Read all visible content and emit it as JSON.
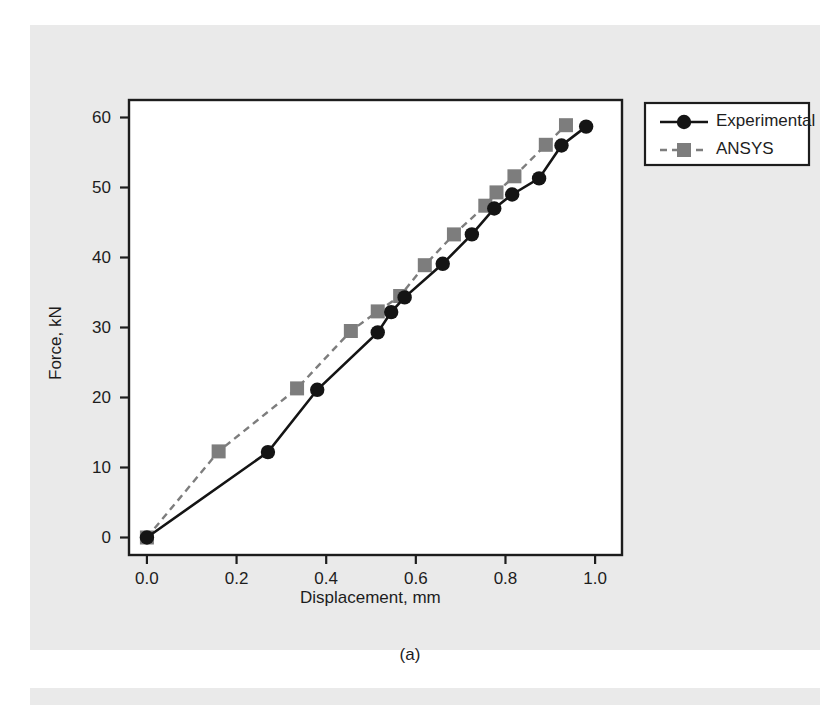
{
  "figure": {
    "caption": "(a)",
    "background_color": "#eaeaea",
    "plot_background_color": "#ffffff",
    "frame_color": "#1d1d1d"
  },
  "chart_data": {
    "type": "line",
    "title": "",
    "xlabel": "Displacement, mm",
    "ylabel": "Force, kN",
    "xlim": [
      -0.04,
      1.06
    ],
    "ylim": [
      -2.5,
      62.5
    ],
    "xticks": [
      "0.0",
      "0.2",
      "0.4",
      "0.6",
      "0.8",
      "1.0"
    ],
    "xtick_values": [
      0.0,
      0.2,
      0.4,
      0.6,
      0.8,
      1.0
    ],
    "yticks": [
      "0",
      "10",
      "20",
      "30",
      "40",
      "50",
      "60"
    ],
    "ytick_values": [
      0,
      10,
      20,
      30,
      40,
      50,
      60
    ],
    "grid": false,
    "legend_position": "outside top-right",
    "series": [
      {
        "name": "Experimental",
        "color": "#141414",
        "marker": "circle",
        "linestyle": "solid",
        "x": [
          0.0,
          0.27,
          0.38,
          0.515,
          0.545,
          0.575,
          0.66,
          0.725,
          0.775,
          0.815,
          0.875,
          0.925,
          0.98
        ],
        "y": [
          0.0,
          12.2,
          21.1,
          29.3,
          32.2,
          34.3,
          39.1,
          43.3,
          47.0,
          49.0,
          51.3,
          56.0,
          58.7
        ]
      },
      {
        "name": "ANSYS",
        "color": "#7d7d7d",
        "marker": "square",
        "linestyle": "dashed",
        "x": [
          0.0,
          0.16,
          0.335,
          0.455,
          0.515,
          0.565,
          0.62,
          0.685,
          0.755,
          0.78,
          0.82,
          0.89,
          0.935
        ],
        "y": [
          0.0,
          12.3,
          21.3,
          29.5,
          32.3,
          34.5,
          38.9,
          43.3,
          47.4,
          49.3,
          51.6,
          56.1,
          58.9
        ]
      }
    ]
  },
  "legend": {
    "items": [
      {
        "label": "Experimental",
        "marker": "circle",
        "color": "#141414",
        "linestyle": "solid"
      },
      {
        "label": "ANSYS",
        "marker": "square",
        "color": "#7d7d7d",
        "linestyle": "dashed"
      }
    ]
  }
}
